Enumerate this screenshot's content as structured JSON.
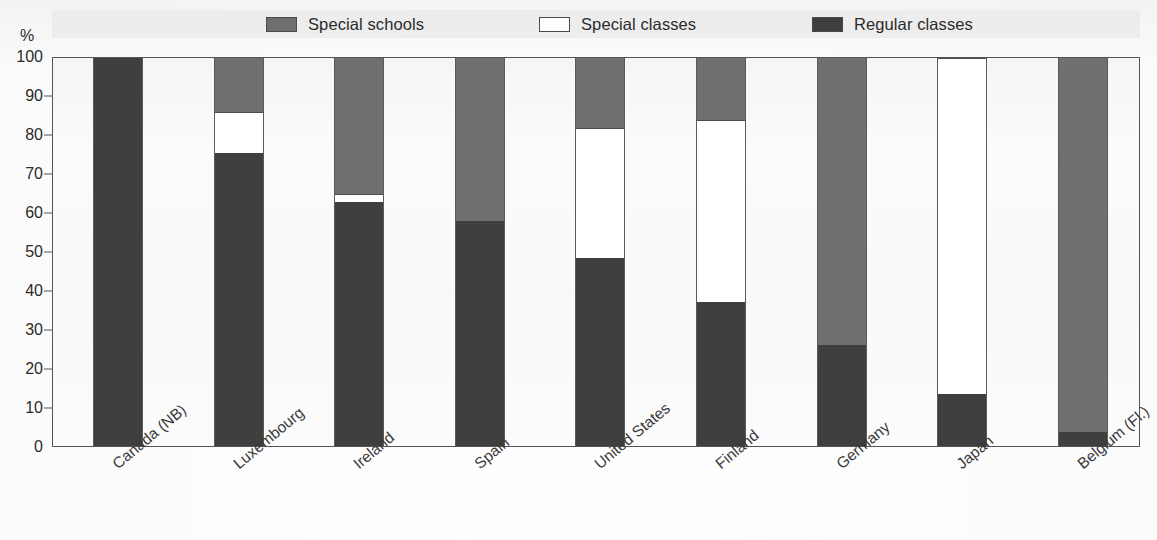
{
  "axis": {
    "y_unit": "%",
    "y_ticks": [
      0,
      10,
      20,
      30,
      40,
      50,
      60,
      70,
      80,
      90,
      100
    ]
  },
  "legend": {
    "items": [
      {
        "label": "Special schools",
        "key": "special_schools",
        "color": "#6f6f6f",
        "swatch_icon": "legend-swatch-icon"
      },
      {
        "label": "Special classes",
        "key": "special_classes",
        "color": "#ffffff",
        "swatch_icon": "legend-swatch-icon"
      },
      {
        "label": "Regular classes",
        "key": "regular_classes",
        "color": "#3f3f3f",
        "swatch_icon": "legend-swatch-icon"
      }
    ]
  },
  "chart_data": {
    "type": "bar",
    "subtype": "stacked-bar-100-percent",
    "title": "",
    "xlabel": "",
    "ylabel": "%",
    "ylim": [
      0,
      100
    ],
    "ytick_step": 10,
    "grid": false,
    "legend_position": "top",
    "categories": [
      "Canada (NB)",
      "Luxembourg",
      "Ireland",
      "Spain",
      "United States",
      "Finland",
      "Germany",
      "Japan",
      "Belgium (Fl.)"
    ],
    "series": [
      {
        "name": "Regular classes",
        "key": "regular_classes",
        "color": "#3f3f3f",
        "values": [
          100,
          75.5,
          63,
          58,
          48.5,
          37,
          26,
          13.5,
          3.5
        ]
      },
      {
        "name": "Special classes",
        "key": "special_classes",
        "color": "#ffffff",
        "values": [
          0,
          10.5,
          2,
          0,
          33.5,
          47,
          0,
          86.5,
          0
        ]
      },
      {
        "name": "Special schools",
        "key": "special_schools",
        "color": "#6f6f6f",
        "values": [
          0,
          14,
          35,
          42,
          18,
          16,
          74,
          0,
          96.5
        ]
      }
    ],
    "stack_order_bottom_to_top": [
      "regular_classes",
      "special_classes",
      "special_schools"
    ],
    "bars": [
      {
        "category": "Canada (NB)",
        "regular_classes": 100,
        "special_classes": 0,
        "special_schools": 0
      },
      {
        "category": "Luxembourg",
        "regular_classes": 75.5,
        "special_classes": 10.5,
        "special_schools": 14
      },
      {
        "category": "Ireland",
        "regular_classes": 63,
        "special_classes": 2,
        "special_schools": 35
      },
      {
        "category": "Spain",
        "regular_classes": 58,
        "special_classes": 0,
        "special_schools": 42
      },
      {
        "category": "United States",
        "regular_classes": 48.5,
        "special_classes": 33.5,
        "special_schools": 18
      },
      {
        "category": "Finland",
        "regular_classes": 37,
        "special_classes": 47,
        "special_schools": 16
      },
      {
        "category": "Germany",
        "regular_classes": 26,
        "special_classes": 0,
        "special_schools": 74
      },
      {
        "category": "Japan",
        "regular_classes": 13.5,
        "special_classes": 86.5,
        "special_schools": 0
      },
      {
        "category": "Belgium (Fl.)",
        "regular_classes": 3.5,
        "special_classes": 0,
        "special_schools": 96.5
      }
    ]
  }
}
